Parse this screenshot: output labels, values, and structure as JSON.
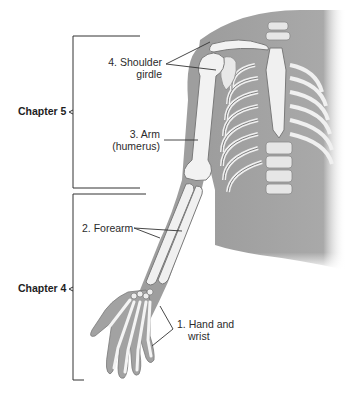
{
  "chapters": [
    {
      "label": "Chapter 5",
      "bracket_top": 36,
      "bracket_bottom": 188
    },
    {
      "label": "Chapter 4",
      "bracket_top": 194,
      "bracket_bottom": 380
    }
  ],
  "labels": [
    {
      "id": "shoulder-girdle",
      "line1": "4. Shoulder",
      "line2": "girdle"
    },
    {
      "id": "arm",
      "line1": "3. Arm",
      "line2": "(humerus)"
    },
    {
      "id": "forearm",
      "line1": "2. Forearm",
      "line2": ""
    },
    {
      "id": "hand-wrist",
      "line1": "1. Hand and",
      "line2": "wrist"
    }
  ],
  "colors": {
    "skin": "#9a9a9a",
    "skin_light": "#bdbdbd",
    "bone": "#f2f2f2",
    "bone_edge": "#8a8a8a",
    "line": "#333333"
  }
}
